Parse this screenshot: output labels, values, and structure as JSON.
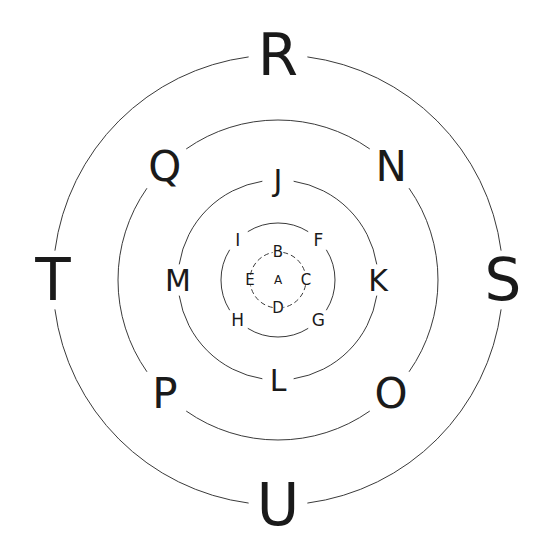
{
  "diagram": {
    "center": {
      "x": 278,
      "y": 280
    },
    "stroke_color": "#3a3a3a",
    "text_color": "#1a1a1a",
    "center_label": {
      "text": "A",
      "x": 278,
      "y": 280,
      "size": 12
    },
    "rings": [
      {
        "name": "ring-1",
        "radius": 28,
        "dashed": true,
        "font_size": 15,
        "gap_deg": 22,
        "labels": [
          {
            "text": "B",
            "angle": 270
          },
          {
            "text": "C",
            "angle": 0
          },
          {
            "text": "D",
            "angle": 90
          },
          {
            "text": "E",
            "angle": 180
          }
        ]
      },
      {
        "name": "ring-2",
        "radius": 57,
        "dashed": false,
        "font_size": 17,
        "gap_deg": 26,
        "labels": [
          {
            "text": "F",
            "angle": 315
          },
          {
            "text": "G",
            "angle": 45
          },
          {
            "text": "H",
            "angle": 135
          },
          {
            "text": "I",
            "angle": 225
          }
        ]
      },
      {
        "name": "ring-3",
        "radius": 100,
        "dashed": false,
        "font_size": 30,
        "gap_deg": 18,
        "labels": [
          {
            "text": "J",
            "angle": 270
          },
          {
            "text": "K",
            "angle": 0
          },
          {
            "text": "L",
            "angle": 90
          },
          {
            "text": "M",
            "angle": 180
          }
        ]
      },
      {
        "name": "ring-4",
        "radius": 160,
        "dashed": false,
        "font_size": 42,
        "gap_deg": 20,
        "labels": [
          {
            "text": "N",
            "angle": 315
          },
          {
            "text": "O",
            "angle": 45
          },
          {
            "text": "P",
            "angle": 135
          },
          {
            "text": "Q",
            "angle": 225
          }
        ]
      },
      {
        "name": "ring-5",
        "radius": 225,
        "dashed": false,
        "font_size": 58,
        "gap_deg": 15,
        "labels": [
          {
            "text": "R",
            "angle": 270
          },
          {
            "text": "S",
            "angle": 0
          },
          {
            "text": "U",
            "angle": 90
          },
          {
            "text": "T",
            "angle": 180
          }
        ]
      }
    ]
  }
}
